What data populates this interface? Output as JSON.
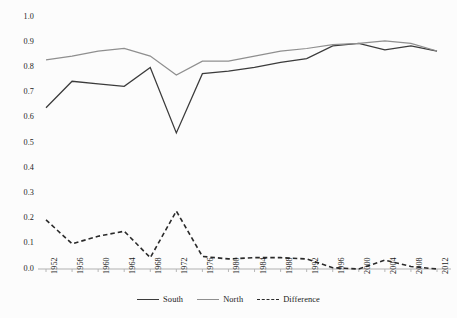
{
  "chart_data": {
    "type": "line",
    "title": "",
    "subtitle": "",
    "xlabel": "",
    "ylabel": "",
    "x": [
      1952,
      1956,
      1960,
      1964,
      1968,
      1972,
      1976,
      1980,
      1984,
      1988,
      1992,
      1996,
      2000,
      2004,
      2008,
      2012
    ],
    "categories": [
      "1952",
      "1956",
      "1960",
      "1964",
      "1968",
      "1972",
      "1976",
      "1980",
      "1984",
      "1988",
      "1992",
      "1996",
      "2000",
      "2004",
      "2008",
      "2012"
    ],
    "series": [
      {
        "name": "South",
        "style": "solid",
        "color": "#3b3b3b",
        "values": [
          0.64,
          0.745,
          0.735,
          0.725,
          0.8,
          0.54,
          0.775,
          0.785,
          0.8,
          0.82,
          0.835,
          0.885,
          0.895,
          0.87,
          0.885,
          0.865
        ]
      },
      {
        "name": "North",
        "style": "solid",
        "color": "#8f8f8f",
        "values": [
          0.83,
          0.845,
          0.865,
          0.875,
          0.845,
          0.77,
          0.825,
          0.825,
          0.845,
          0.865,
          0.875,
          0.89,
          0.895,
          0.905,
          0.895,
          0.865
        ]
      },
      {
        "name": "Difference",
        "style": "dashed",
        "color": "#2a2a2a",
        "values": [
          0.195,
          0.1,
          0.13,
          0.15,
          0.045,
          0.23,
          0.05,
          0.04,
          0.045,
          0.045,
          0.04,
          0.005,
          0.0,
          0.035,
          0.01,
          0.0
        ]
      }
    ],
    "ylim": [
      0.0,
      1.0
    ],
    "yticks": [
      "0.0",
      "0.1",
      "0.2",
      "0.3",
      "0.4",
      "0.5",
      "0.6",
      "0.7",
      "0.8",
      "0.9",
      "1.0"
    ],
    "ytick_values": [
      0.0,
      0.1,
      0.2,
      0.3,
      0.4,
      0.5,
      0.6,
      0.7,
      0.8,
      0.9,
      1.0
    ],
    "grid": false,
    "legend_position": "bottom",
    "legend": [
      {
        "label": "South",
        "style": "solid",
        "color": "#3b3b3b"
      },
      {
        "label": "North",
        "style": "solid",
        "color": "#8f8f8f"
      },
      {
        "label": "Difference",
        "style": "dashed",
        "color": "#2a2a2a"
      }
    ],
    "axis_color": "#b0b0b0",
    "background": "#fcfcfc"
  }
}
